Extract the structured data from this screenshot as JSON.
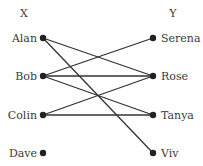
{
  "diagram": {
    "type": "bipartite-graph",
    "left_set_label": "X",
    "right_set_label": "Y",
    "left_nodes": [
      "Alan",
      "Bob",
      "Colin",
      "Dave"
    ],
    "right_nodes": [
      "Serena",
      "Rose",
      "Tanya",
      "Viv"
    ],
    "edges": [
      {
        "from": "Alan",
        "to": "Rose"
      },
      {
        "from": "Alan",
        "to": "Viv"
      },
      {
        "from": "Bob",
        "to": "Serena"
      },
      {
        "from": "Bob",
        "to": "Rose"
      },
      {
        "from": "Bob",
        "to": "Tanya"
      },
      {
        "from": "Colin",
        "to": "Rose"
      },
      {
        "from": "Colin",
        "to": "Tanya"
      }
    ],
    "colors": {
      "line": "#333333",
      "node": "#222222",
      "text": "#3a3a3a"
    }
  }
}
